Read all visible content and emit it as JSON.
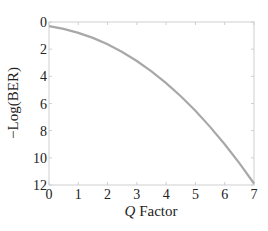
{
  "chart_data": {
    "type": "line",
    "title": "",
    "xlabel_italic": "Q",
    "xlabel_rest": " Factor",
    "xlabel": "Q Factor",
    "ylabel": "−Log(BER)",
    "xlim": [
      0,
      7
    ],
    "ylim": [
      0,
      12
    ],
    "y_inverted": true,
    "grid": false,
    "xticks": [
      "0",
      "1",
      "2",
      "3",
      "4",
      "5",
      "6",
      "7"
    ],
    "yticks": [
      "0",
      "2",
      "4",
      "6",
      "8",
      "10",
      "12"
    ],
    "series": [
      {
        "name": "-Log(BER)",
        "color": "#a8a8a8",
        "x": [
          0,
          0.5,
          1,
          1.5,
          2,
          2.5,
          3,
          3.5,
          4,
          4.5,
          5,
          5.5,
          6,
          6.5,
          7
        ],
        "values": [
          0.3,
          0.51,
          0.8,
          1.17,
          1.64,
          2.21,
          2.87,
          3.63,
          4.5,
          5.47,
          6.54,
          7.72,
          9.0,
          10.39,
          11.89
        ]
      }
    ]
  },
  "colors": {
    "axis": "#cfcfcf",
    "line": "#a8a8a8",
    "text": "#222222"
  }
}
